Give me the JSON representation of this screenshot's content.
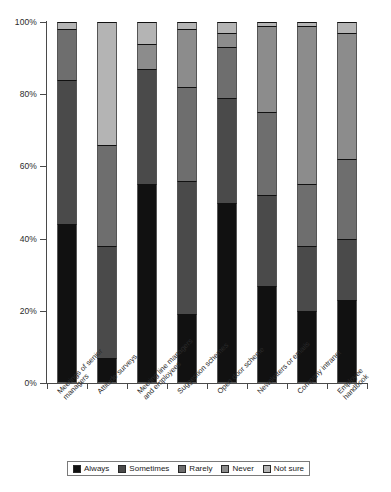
{
  "chart_data": {
    "type": "bar",
    "subtype": "stacked-percentage-column",
    "title": "",
    "xlabel": "",
    "ylabel": "",
    "ylim": [
      0,
      100
    ],
    "yticks": [
      "0%",
      "20%",
      "40%",
      "60%",
      "80%",
      "100%"
    ],
    "ytick_values": [
      0,
      20,
      40,
      60,
      80,
      100
    ],
    "grid": false,
    "legend_position": "bottom",
    "categories": [
      "Meetings of senior managers",
      "Attitude surveys",
      "Meeting line managers and employees",
      "Suggestion schemes",
      "Open door scheme",
      "Newsletters or emails",
      "Company intranet",
      "Employee handbook"
    ],
    "series": [
      {
        "name": "Always",
        "color": "#111111",
        "values": [
          44,
          7,
          55,
          19,
          50,
          27,
          20,
          23
        ]
      },
      {
        "name": "Sometimes",
        "color": "#4a4a4a",
        "values": [
          40,
          31,
          32,
          37,
          29,
          25,
          18,
          17
        ]
      },
      {
        "name": "Rarely",
        "color": "#6e6e6e",
        "values": [
          14,
          28,
          0,
          26,
          14,
          23,
          17,
          22
        ]
      },
      {
        "name": "Never",
        "color": "#8c8c8c",
        "values": [
          0,
          0,
          7,
          16,
          4,
          24,
          44,
          35
        ]
      },
      {
        "name": "Not sure",
        "color": "#b4b4b4",
        "values": [
          2,
          34,
          6,
          2,
          3,
          1,
          1,
          3
        ]
      }
    ]
  },
  "axis": {
    "ytick_labels": [
      "100%",
      "80%",
      "60%",
      "40%",
      "20%",
      "0%"
    ]
  },
  "legend": {
    "items": [
      {
        "label": "Always",
        "color": "#111111"
      },
      {
        "label": "Sometimes",
        "color": "#4a4a4a"
      },
      {
        "label": "Rarely",
        "color": "#6e6e6e"
      },
      {
        "label": "Never",
        "color": "#8c8c8c"
      },
      {
        "label": "Not sure",
        "color": "#b4b4b4"
      }
    ]
  },
  "xlabels": [
    "Meetings of senior\nmanagers",
    "Attitude surveys",
    "Meeting line managers\nand employees",
    "Suggestion schemes",
    "Open door scheme",
    "Newsletters or emails",
    "Company intranet",
    "Employee handbook"
  ]
}
